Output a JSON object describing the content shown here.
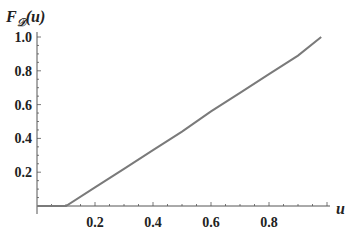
{
  "chart_data": {
    "type": "line",
    "title": "",
    "xlabel": "u",
    "ylabel": "F_D(u)",
    "ylabel_main": "F",
    "ylabel_sub": "𝒟",
    "ylabel_arg": "(u)",
    "xlim": [
      0,
      1.0
    ],
    "ylim": [
      0,
      1.0
    ],
    "grid": false,
    "legend": null,
    "x_ticks": [
      0.2,
      0.4,
      0.6,
      0.8
    ],
    "x_tick_labels": [
      "0.2",
      "0.4",
      "0.6",
      "0.8"
    ],
    "y_ticks": [
      0.2,
      0.4,
      0.6,
      0.8,
      1.0
    ],
    "y_tick_labels": [
      "0.2",
      "0.4",
      "0.6",
      "0.8",
      "1.0"
    ],
    "series": [
      {
        "name": "F_D(u)",
        "color": "#7a7a7a",
        "x": [
          0.0,
          0.1,
          0.2,
          0.3,
          0.4,
          0.5,
          0.6,
          0.7,
          0.8,
          0.9,
          0.98
        ],
        "y": [
          0.0,
          0.0,
          0.11,
          0.22,
          0.33,
          0.44,
          0.56,
          0.67,
          0.78,
          0.89,
          1.0
        ]
      }
    ]
  },
  "colors": {
    "axis": "#555555",
    "line": "#7a7a7a",
    "text": "#222222"
  }
}
